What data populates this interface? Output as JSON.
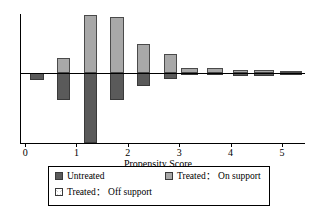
{
  "chart_data": {
    "type": "bar",
    "subtype": "back-to-back-histogram",
    "title": "",
    "xlabel": "Propensity Score",
    "ylabel": "",
    "xlim": [
      -0.1,
      5.45
    ],
    "xticks": [
      0,
      1,
      2,
      3,
      4,
      5
    ],
    "xtick_labels": [
      "0",
      "1",
      "2",
      "3",
      "4",
      "5"
    ],
    "ylim": [
      -1.38,
      1.16
    ],
    "grid": false,
    "legend_position": "below-axis",
    "bin_width": 0.26,
    "series": [
      {
        "name": "Treated: On support",
        "color": "#a8a8a8",
        "direction": "up",
        "bins": [
          {
            "x0": 0.1,
            "x1": 0.36,
            "value": 0.0
          },
          {
            "x0": 0.36,
            "x1": 0.62,
            "value": 0.0
          },
          {
            "x0": 0.62,
            "x1": 0.88,
            "value": 0.29
          },
          {
            "x0": 0.88,
            "x1": 1.14,
            "value": 0.0
          },
          {
            "x0": 1.14,
            "x1": 1.4,
            "value": 1.14
          },
          {
            "x0": 1.4,
            "x1": 1.66,
            "value": 0.0
          },
          {
            "x0": 1.66,
            "x1": 1.92,
            "value": 1.1
          },
          {
            "x0": 1.92,
            "x1": 2.18,
            "value": 0.0
          },
          {
            "x0": 2.18,
            "x1": 2.44,
            "value": 0.58
          },
          {
            "x0": 2.44,
            "x1": 2.7,
            "value": 0.0
          },
          {
            "x0": 2.7,
            "x1": 2.96,
            "value": 0.37
          },
          {
            "x0": 3.04,
            "x1": 3.36,
            "value": 0.1
          },
          {
            "x0": 3.54,
            "x1": 3.86,
            "value": 0.1
          },
          {
            "x0": 4.04,
            "x1": 4.34,
            "value": 0.05
          },
          {
            "x0": 4.46,
            "x1": 4.84,
            "value": 0.06
          },
          {
            "x0": 4.96,
            "x1": 5.4,
            "value": 0.02
          }
        ]
      },
      {
        "name": "Untreated",
        "color": "#5a5a5a",
        "direction": "down",
        "bins": [
          {
            "x0": 0.1,
            "x1": 0.36,
            "value": 0.13
          },
          {
            "x0": 0.36,
            "x1": 0.62,
            "value": 0.0
          },
          {
            "x0": 0.62,
            "x1": 0.88,
            "value": 0.53
          },
          {
            "x0": 0.88,
            "x1": 1.14,
            "value": 0.0
          },
          {
            "x0": 1.14,
            "x1": 1.4,
            "value": 1.38
          },
          {
            "x0": 1.4,
            "x1": 1.66,
            "value": 0.0
          },
          {
            "x0": 1.66,
            "x1": 1.92,
            "value": 0.53
          },
          {
            "x0": 1.92,
            "x1": 2.18,
            "value": 0.0
          },
          {
            "x0": 2.18,
            "x1": 2.44,
            "value": 0.25
          },
          {
            "x0": 2.44,
            "x1": 2.7,
            "value": 0.0
          },
          {
            "x0": 2.7,
            "x1": 2.96,
            "value": 0.12
          },
          {
            "x0": 3.04,
            "x1": 3.36,
            "value": 0.03
          },
          {
            "x0": 3.54,
            "x1": 3.86,
            "value": 0.03
          },
          {
            "x0": 4.04,
            "x1": 4.34,
            "value": 0.05
          },
          {
            "x0": 4.46,
            "x1": 4.84,
            "value": 0.06
          },
          {
            "x0": 4.96,
            "x1": 5.4,
            "value": 0.02
          }
        ]
      },
      {
        "name": "Treated: Off support",
        "color": "#d0d0d0",
        "direction": "up",
        "bins": []
      }
    ]
  },
  "axis": {
    "xlabel": "Propensity Score",
    "ticks": [
      {
        "value": 0,
        "label": "0"
      },
      {
        "value": 1,
        "label": "1"
      },
      {
        "value": 2,
        "label": "2"
      },
      {
        "value": 3,
        "label": "3"
      },
      {
        "value": 4,
        "label": "4"
      },
      {
        "value": 5,
        "label": "5"
      }
    ]
  },
  "legend": {
    "entries": [
      {
        "label": "Untreated",
        "style": "dark"
      },
      {
        "label": "Treated： On support",
        "style": "light"
      },
      {
        "label": "Treated： Off support",
        "style": "hatch"
      }
    ]
  }
}
